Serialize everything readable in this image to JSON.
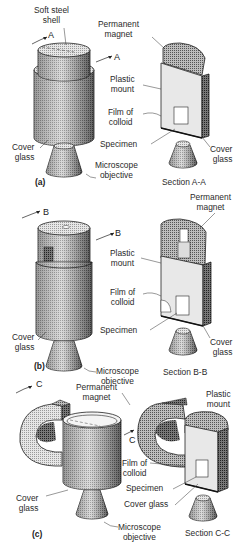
{
  "figure": {
    "panels": [
      {
        "id": "a",
        "panel_label": "(a)",
        "section_label": "Section A-A",
        "cut_marker": "A",
        "labels": {
          "soft_steel_shell": "Soft steel\nshell",
          "permanent_magnet": "Permanent\nmagnet",
          "plastic_mount": "Plastic\nmount",
          "film_of_colloid": "Film of\ncolloid",
          "specimen": "Specimen",
          "cover_glass_left": "Cover\nglass",
          "cover_glass_right": "Cover\nglass",
          "microscope_objective": "Microscope\nobjective"
        }
      },
      {
        "id": "b",
        "panel_label": "(b)",
        "section_label": "Section B-B",
        "cut_marker": "B",
        "labels": {
          "permanent_magnet": "Permanent\nmagnet",
          "plastic_mount": "Plastic\nmount",
          "film_of_colloid": "Film of\ncolloid",
          "specimen": "Specimen",
          "cover_glass_left": "Cover\nglass",
          "cover_glass_right": "Cover\nglass",
          "microscope_objective": "Microscope\nobjective"
        }
      },
      {
        "id": "c",
        "panel_label": "(c)",
        "section_label": "Section C-C",
        "cut_marker": "C",
        "labels": {
          "permanent_magnet": "Permanent\nmagnet",
          "plastic_mount": "Plastic\nmount",
          "film_of_colloid": "Film of\ncolloid",
          "specimen": "Specimen",
          "cover_glass_left": "Cover\nglass",
          "cover_glass_right": "Cover glass",
          "microscope_objective": "Microscope\nobjective"
        }
      }
    ]
  }
}
